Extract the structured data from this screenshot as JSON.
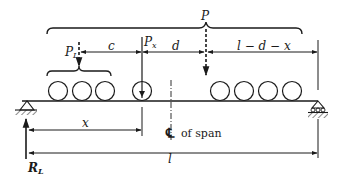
{
  "diagram": {
    "type": "simply supported beam with moving wheel loads",
    "colors": {
      "ink": "#1a1a1a",
      "background": "#ffffff"
    },
    "labels": {
      "resultant_load": "P",
      "lead_load": "P",
      "lead_load_sub": "L",
      "wheel_load": "P",
      "wheel_load_sub": "x",
      "dim_c": "c",
      "dim_d": "d",
      "dim_remaining": "l − d − x",
      "dim_x": "x",
      "dim_span": "l",
      "reaction": "R",
      "reaction_sub": "L",
      "centerline_symbol": "℄",
      "centerline_text": "of span"
    },
    "elements": {
      "left_support": "pin-support",
      "right_support": "roller-support",
      "left_wheel_group_count": 3,
      "right_wheel_group_count": 4,
      "critical_wheel_count": 1
    }
  }
}
